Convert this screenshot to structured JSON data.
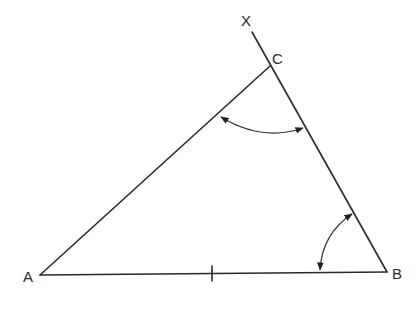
{
  "diagram": {
    "type": "triangle-construction",
    "colors": {
      "stroke": "#2a2a2a",
      "background": "#ffffff"
    },
    "points": {
      "A": {
        "label": "A",
        "x": 40,
        "y": 275
      },
      "B": {
        "label": "B",
        "x": 387,
        "y": 272
      },
      "C": {
        "label": "C",
        "x": 270,
        "y": 66
      },
      "X": {
        "label": "X",
        "x": 252,
        "y": 32
      }
    },
    "labels": {
      "A": "A",
      "B": "B",
      "C": "C",
      "X": "X"
    },
    "segments": [
      {
        "name": "AB",
        "from": "A",
        "to": "B"
      },
      {
        "name": "AC",
        "from": "A",
        "to": "C"
      },
      {
        "name": "BX",
        "from": "B",
        "to": "X",
        "note": "ray from B through C extended to X"
      }
    ],
    "marks": [
      {
        "type": "tick",
        "on": "AB",
        "x": 212,
        "y": 273
      },
      {
        "type": "angle-arc-double-arrow",
        "at": "C",
        "between": [
          "CA",
          "CB"
        ]
      },
      {
        "type": "angle-arc-double-arrow",
        "at": "B",
        "between": [
          "BA",
          "BC"
        ]
      }
    ]
  }
}
